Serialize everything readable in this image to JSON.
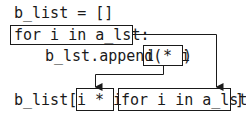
{
  "code": {
    "line1": "b_list = []",
    "line2": "for i in a_lst:",
    "line3_prefix": "b_lst.append(",
    "line3_expr": "i * i",
    "line3_suffix": ")",
    "line4_prefix": "b_list[",
    "line4_expr": "i * i",
    "line4_loop": "for i in a_lst",
    "line4_suffix": "]"
  }
}
